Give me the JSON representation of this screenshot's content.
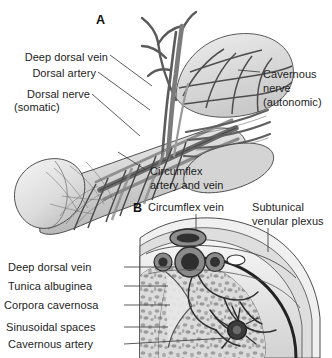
{
  "figure": {
    "title_alt": "Penile vascular and neural anatomy",
    "background_color": "#ffffff",
    "ink_color": "#1d1d1d",
    "panels": [
      {
        "letter": "A",
        "name": "panel-a-longitudinal",
        "labels": [
          {
            "id": "deep-dorsal-vein",
            "text": "Deep dorsal vein",
            "x": 22,
            "y": 57,
            "align": "right",
            "leader": "to dorsal vessel bundle"
          },
          {
            "id": "dorsal-artery",
            "text": "Dorsal artery",
            "x": 22,
            "y": 74,
            "align": "right",
            "leader": "to dorsal vessel bundle"
          },
          {
            "id": "dorsal-nerve",
            "text": "Dorsal nerve",
            "x": 22,
            "y": 93,
            "align": "right",
            "leader": "to nerve fascicles"
          },
          {
            "id": "dorsal-nerve-sub",
            "text": "(somatic)",
            "x": 22,
            "y": 106,
            "align": "right",
            "leader": ""
          },
          {
            "id": "cavernous-nerve",
            "text": "Cavernous",
            "x": 262,
            "y": 74,
            "align": "left",
            "leader": "to autonomic nerve trunk"
          },
          {
            "id": "cavernous-nerve-2",
            "text": "nerve",
            "x": 262,
            "y": 88,
            "align": "left",
            "leader": ""
          },
          {
            "id": "cavernous-nerve-sub",
            "text": "(autonomic)",
            "x": 262,
            "y": 102,
            "align": "left",
            "leader": ""
          },
          {
            "id": "circumflex-artery-vein",
            "text": "Circumflex",
            "x": 148,
            "y": 172,
            "align": "left",
            "leader": "to circumflex vessels"
          },
          {
            "id": "circumflex-artery-vein-2",
            "text": "artery and vein",
            "x": 148,
            "y": 186,
            "align": "left",
            "leader": ""
          }
        ]
      },
      {
        "letter": "B",
        "name": "panel-b-cross-section",
        "labels": [
          {
            "id": "circumflex-vein",
            "text": "Circumflex vein",
            "x": 146,
            "y": 207,
            "align": "left",
            "leader": "to superficial vein"
          },
          {
            "id": "subtunical-plexus",
            "text": "Subtunical",
            "x": 252,
            "y": 207,
            "align": "left",
            "leader": "to subtunical venular plexus"
          },
          {
            "id": "subtunical-plexus-2",
            "text": "venular plexus",
            "x": 252,
            "y": 221,
            "align": "left",
            "leader": ""
          },
          {
            "id": "deep-dorsal-vein-b",
            "text": "Deep dorsal vein",
            "x": 120,
            "y": 269,
            "align": "right",
            "leader": "to deep dorsal vein"
          },
          {
            "id": "tunica-albuginea",
            "text": "Tunica albuginea",
            "x": 120,
            "y": 288,
            "align": "right",
            "leader": "to tunica layer"
          },
          {
            "id": "corpora-cavernosa",
            "text": "Corpora cavernosa",
            "x": 120,
            "y": 307,
            "align": "right",
            "leader": "to corpus body"
          },
          {
            "id": "sinusoidal-spaces",
            "text": "Sinusoidal spaces",
            "x": 120,
            "y": 329,
            "align": "right",
            "leader": "to sinusoids"
          },
          {
            "id": "cavernous-artery",
            "text": "Cavernous artery",
            "x": 120,
            "y": 346,
            "align": "right",
            "leader": "to cavernous artery"
          }
        ]
      }
    ],
    "palette": {
      "tissue_light": "#dcdcdc",
      "tissue_mid": "#bdbdbd",
      "tissue_dark": "#8f8f8f",
      "vessel_dark": "#3a3a3a",
      "vessel_mid": "#707070",
      "outline": "#2b2b2b",
      "leader": "#4a4a4a",
      "white": "#ffffff"
    }
  }
}
